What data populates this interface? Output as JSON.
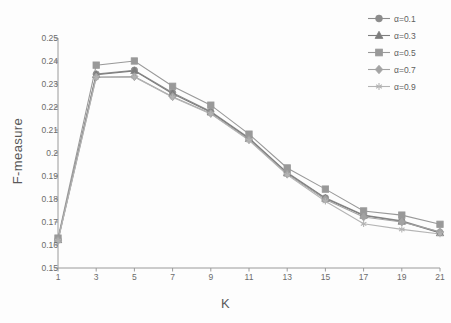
{
  "chart_data": {
    "type": "line",
    "title": "",
    "subtitle": "",
    "xlabel": "K",
    "ylabel": "F-measure",
    "x": [
      1,
      3,
      5,
      7,
      9,
      11,
      13,
      15,
      17,
      19,
      21
    ],
    "xtick_labels": [
      "1",
      "3",
      "5",
      "7",
      "9",
      "11",
      "13",
      "15",
      "17",
      "19",
      "21"
    ],
    "ytick_labels": [
      "0.15",
      "0.16",
      "0.17",
      "0.18",
      "0.19",
      "0.2",
      "0.21",
      "0.22",
      "0.23",
      "0.24",
      "0.25"
    ],
    "ytick_values": [
      0.15,
      0.16,
      0.17,
      0.18,
      0.19,
      0.2,
      0.21,
      0.22,
      0.23,
      0.24,
      0.25
    ],
    "xlim": [
      1,
      21
    ],
    "ylim": [
      0.15,
      0.25
    ],
    "grid": false,
    "legend_position": "top-right",
    "series": [
      {
        "name": "α=0.1",
        "marker": "circle",
        "color": "#8c8c8c",
        "values": [
          0.1625,
          0.2343,
          0.236,
          0.2262,
          0.218,
          0.2065,
          0.1915,
          0.1805,
          0.173,
          0.1705,
          0.1655
        ]
      },
      {
        "name": "α=0.3",
        "marker": "triangle",
        "color": "#7d7d7d",
        "values": [
          0.1622,
          0.234,
          0.2357,
          0.2258,
          0.2177,
          0.2062,
          0.1912,
          0.1802,
          0.1728,
          0.1702,
          0.1652
        ]
      },
      {
        "name": "α=0.5",
        "marker": "square",
        "color": "#999999",
        "values": [
          0.163,
          0.2382,
          0.24,
          0.229,
          0.2208,
          0.2082,
          0.1935,
          0.1843,
          0.1748,
          0.173,
          0.169
        ]
      },
      {
        "name": "α=0.7",
        "marker": "diamond",
        "color": "#a3a3a3",
        "values": [
          0.162,
          0.233,
          0.2332,
          0.2245,
          0.2172,
          0.2058,
          0.1908,
          0.1798,
          0.1722,
          0.17,
          0.1658
        ]
      },
      {
        "name": "α=0.9",
        "marker": "star",
        "color": "#b4b4b4",
        "values": [
          0.1618,
          0.2328,
          0.233,
          0.2242,
          0.217,
          0.2055,
          0.1905,
          0.179,
          0.1692,
          0.1668,
          0.1648
        ]
      }
    ],
    "axis_color": "#9a9a9a"
  }
}
